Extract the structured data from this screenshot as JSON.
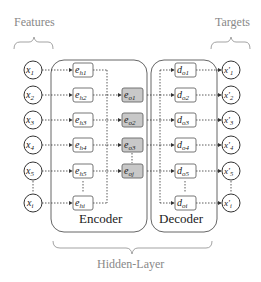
{
  "labels": {
    "features": "Features",
    "targets": "Targets",
    "encoder": "Encoder",
    "decoder": "Decoder",
    "hidden_layer": "Hidden-Layer"
  },
  "inputs": [
    {
      "base": "x",
      "sub": "1"
    },
    {
      "base": "x",
      "sub": "2"
    },
    {
      "base": "x",
      "sub": "3"
    },
    {
      "base": "x",
      "sub": "4"
    },
    {
      "base": "x",
      "sub": "5"
    },
    {
      "base": "x",
      "sub": "i"
    }
  ],
  "encoder_hidden": [
    {
      "base": "e",
      "sub": "h1"
    },
    {
      "base": "e",
      "sub": "h2"
    },
    {
      "base": "e",
      "sub": "h3"
    },
    {
      "base": "e",
      "sub": "h4"
    },
    {
      "base": "e",
      "sub": "h5"
    },
    {
      "base": "e",
      "sub": "hi"
    }
  ],
  "encoder_output": [
    {
      "base": "e",
      "sub": "o1"
    },
    {
      "base": "e",
      "sub": "o2"
    },
    {
      "base": "e",
      "sub": "o3"
    },
    {
      "base": "e",
      "sub": "oj"
    }
  ],
  "decoder_output": [
    {
      "base": "d",
      "sub": "o1"
    },
    {
      "base": "d",
      "sub": "o2"
    },
    {
      "base": "d",
      "sub": "o3"
    },
    {
      "base": "d",
      "sub": "o4"
    },
    {
      "base": "d",
      "sub": "o5"
    },
    {
      "base": "d",
      "sub": "oi"
    }
  ],
  "targets": [
    {
      "base": "x'",
      "sub": "1"
    },
    {
      "base": "x'",
      "sub": "2"
    },
    {
      "base": "x'",
      "sub": "3"
    },
    {
      "base": "x'",
      "sub": "4"
    },
    {
      "base": "x'",
      "sub": "5"
    },
    {
      "base": "x'",
      "sub": "i"
    }
  ],
  "colors": {
    "stroke": "#333333",
    "label_gray": "#888888",
    "box_gray_fill": "#c8c8c8",
    "box_light_fill": "#ffffff",
    "bracket": "#999999"
  }
}
